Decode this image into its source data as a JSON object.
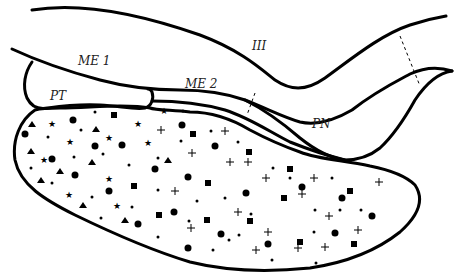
{
  "diagram": {
    "labels": {
      "me1": "ME 1",
      "me2": "ME 2",
      "iii": "III",
      "pt": "PT",
      "pn": "PN"
    },
    "regions": [
      {
        "id": "III",
        "description": "third ventricle region between upper boundary lines"
      },
      {
        "id": "ME 1",
        "description": "median eminence zone 1"
      },
      {
        "id": "ME 2",
        "description": "median eminence zone 2"
      },
      {
        "id": "PT",
        "description": "pars tuberalis, rounded lobe"
      },
      {
        "id": "PN",
        "description": "pars nervosa / neural stalk"
      },
      {
        "id": "PD",
        "description": "large stippled lobe filled with cell-type markers"
      }
    ],
    "marker_types": [
      "dot",
      "circle",
      "square",
      "triangle",
      "star",
      "plus"
    ],
    "colors": {
      "line": "#000000",
      "background": "#ffffff"
    }
  }
}
